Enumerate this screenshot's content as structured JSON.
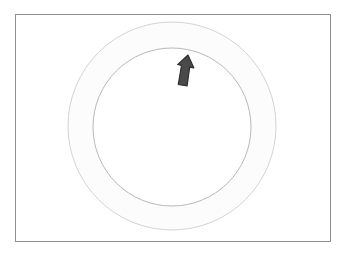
{
  "scene": {
    "title": "Circular dial control",
    "description": "Rectangular panel containing a concentric ring dial with an upward arrow pointer near the top",
    "background_color": "#ffffff"
  },
  "frame": {
    "label": "Panel frame",
    "border_color": "#8e8e8e",
    "fill_color": "#ffffff",
    "x": 15,
    "y": 14,
    "width": 316,
    "height": 228
  },
  "dial": {
    "label": "Dial",
    "center_x": 172,
    "center_y": 126,
    "outer_circle": {
      "label": "Outer ring edge",
      "radius": 104,
      "stroke_color": "#d4d4d4",
      "fill_color": "#fcfcfc"
    },
    "inner_circle": {
      "label": "Inner dial face",
      "radius": 79,
      "stroke_color": "#b9b9b9",
      "fill_color": "#ffffff"
    }
  },
  "pointer": {
    "label": "Arrow pointer",
    "icon": "arrow-up-icon",
    "direction": "up",
    "tip_x": 188,
    "tip_y": 55,
    "rotation_degrees": 12,
    "fill_color": "#4a4a4a",
    "stroke_color": "#2b2b2b"
  }
}
